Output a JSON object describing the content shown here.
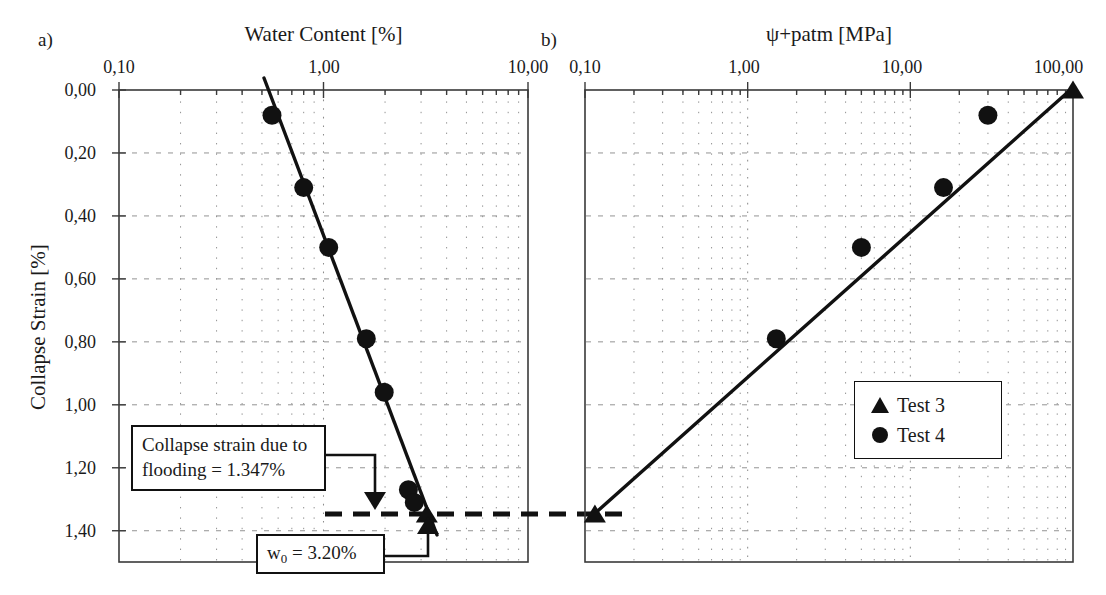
{
  "figure": {
    "panel_a_letter": "a)",
    "panel_b_letter": "b)",
    "y_axis_label": "Collapse Strain [%]"
  },
  "panel_a": {
    "letter": "a)",
    "x_title": "Water Content [%]",
    "x_ticks": [
      "0,10",
      "1,00",
      "10,00"
    ],
    "y_ticks": [
      "0,00",
      "0,20",
      "0,40",
      "0,60",
      "0,80",
      "1,00",
      "1,20",
      "1,40"
    ]
  },
  "panel_b": {
    "letter": "b)",
    "x_title": "ψ+patm [MPa]",
    "x_ticks": [
      "0,10",
      "1,00",
      "10,00",
      "100,00"
    ]
  },
  "annotations": {
    "collapse_box_line1": "Collapse strain due to",
    "collapse_box_line2": "flooding = 1.347%",
    "w0_box_prefix": "w",
    "w0_box_sub": "0",
    "w0_box_suffix": " = 3.20%"
  },
  "legend": {
    "items": [
      {
        "label": "Test 3",
        "marker": "triangle"
      },
      {
        "label": "Test 4",
        "marker": "circle"
      }
    ]
  },
  "colors": {
    "ink": "#111111",
    "frame": "#3a3a3a",
    "grid": "#8d8d8d",
    "background": "#ffffff"
  },
  "chart_data": [
    {
      "type": "scatter",
      "panel": "a",
      "title": "Water Content [%]",
      "xlabel": "Water Content [%]",
      "ylabel": "Collapse Strain [%]",
      "xscale": "log",
      "xlim": [
        0.1,
        10.0
      ],
      "ylim": [
        0.0,
        1.47
      ],
      "y_inverted": true,
      "grid": true,
      "legend_position": "none",
      "xtick_values": [
        0.1,
        1.0,
        10.0
      ],
      "xtick_labels": [
        "0,10",
        "1,00",
        "10,00"
      ],
      "ytick_values": [
        0.0,
        0.2,
        0.4,
        0.6,
        0.8,
        1.0,
        1.2,
        1.4
      ],
      "ytick_labels": [
        "0,00",
        "0,20",
        "0,40",
        "0,60",
        "0,80",
        "1,00",
        "1,20",
        "1,40"
      ],
      "series": [
        {
          "name": "Test 4",
          "marker": "circle",
          "x": [
            0.56,
            0.8,
            1.06,
            1.62,
            1.98,
            2.6,
            2.78
          ],
          "y": [
            0.08,
            0.31,
            0.5,
            0.79,
            0.96,
            1.27,
            1.31
          ]
        },
        {
          "name": "Test 3",
          "marker": "triangle",
          "x": [
            3.2
          ],
          "y": [
            1.347
          ]
        }
      ],
      "fit_line": {
        "x": [
          0.5,
          3.25
        ],
        "y": [
          0.0,
          1.4
        ]
      },
      "reference_lines": [
        {
          "kind": "dashed-horizontal",
          "y": 1.347,
          "label": "collapse strain due to flooding"
        }
      ],
      "annotations": [
        {
          "text": "Collapse strain due to flooding = 1.347%",
          "points_to_y": 1.347
        },
        {
          "text": "w0 = 3.20%",
          "points_to_x": 3.2
        }
      ]
    },
    {
      "type": "scatter",
      "panel": "b",
      "title": "ψ+patm [MPa]",
      "xlabel": "ψ+patm [MPa]",
      "ylabel": "Collapse Strain [%]",
      "xscale": "log",
      "xlim": [
        0.1,
        100.0
      ],
      "ylim": [
        0.0,
        1.47
      ],
      "y_inverted": true,
      "grid": true,
      "legend_position": "lower-right",
      "xtick_values": [
        0.1,
        1.0,
        10.0,
        100.0
      ],
      "xtick_labels": [
        "0,10",
        "1,00",
        "10,00",
        "100,00"
      ],
      "series": [
        {
          "name": "Test 4",
          "marker": "circle",
          "x": [
            30.0,
            16.0,
            5.0,
            1.5
          ],
          "y": [
            0.08,
            0.31,
            0.5,
            0.79
          ]
        },
        {
          "name": "Test 3",
          "marker": "triangle",
          "x": [
            100.0,
            0.115
          ],
          "y": [
            0.0,
            1.347
          ]
        }
      ],
      "fit_line": {
        "x": [
          0.115,
          100.0
        ],
        "y": [
          1.347,
          0.0
        ]
      },
      "reference_lines": [
        {
          "kind": "dashed-horizontal",
          "y": 1.347,
          "label": "collapse strain due to flooding"
        }
      ]
    }
  ]
}
